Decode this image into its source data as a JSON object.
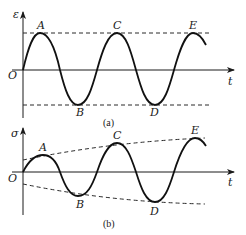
{
  "panel_a": {
    "y_axis_label": "ε",
    "x_axis_label": "t",
    "origin_label": "O",
    "points": {
      "A": "A",
      "B": "B",
      "C": "C",
      "D": "D",
      "E": "E"
    },
    "caption": "(a)",
    "description": "constant-amplitude sinusoidal strain vs time"
  },
  "panel_b": {
    "y_axis_label": "σ",
    "x_axis_label": "t",
    "origin_label": "O",
    "points": {
      "A": "A",
      "B": "B",
      "C": "C",
      "D": "D",
      "E": "E"
    },
    "caption": "(b)",
    "description": "growing-amplitude sinusoidal stress vs time within diverging envelope"
  },
  "colors": {
    "line": "#111111",
    "background": "#ffffff"
  }
}
